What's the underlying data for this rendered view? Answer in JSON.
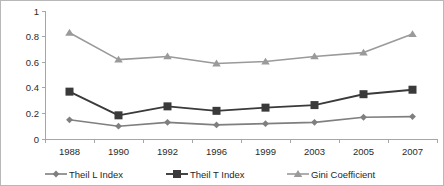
{
  "chart_data": {
    "type": "line",
    "title": "",
    "subtitle": "",
    "xlabel": "",
    "ylabel": "",
    "categories": [
      "1988",
      "1990",
      "1992",
      "1996",
      "1999",
      "2003",
      "2005",
      "2007"
    ],
    "ylim": [
      0,
      1
    ],
    "yticks": [
      "0",
      "0.2",
      "0.4",
      "0.6",
      "0.8",
      "1"
    ],
    "ytick_values": [
      0,
      0.2,
      0.4,
      0.6,
      0.8,
      1
    ],
    "grid": false,
    "legend_position": "bottom",
    "series": [
      {
        "name": "Theil L Index",
        "marker": "diamond",
        "color": "#7f7f7f",
        "values": [
          0.15,
          0.1,
          0.13,
          0.11,
          0.12,
          0.13,
          0.17,
          0.175
        ]
      },
      {
        "name": "Theil T Index",
        "marker": "square",
        "color": "#3a3a3a",
        "values": [
          0.37,
          0.185,
          0.255,
          0.22,
          0.245,
          0.265,
          0.35,
          0.385
        ]
      },
      {
        "name": "Gini Coefficient",
        "marker": "triangle",
        "color": "#9a9a9a",
        "values": [
          0.83,
          0.62,
          0.645,
          0.59,
          0.605,
          0.645,
          0.675,
          0.82
        ]
      }
    ]
  },
  "legend": {
    "items": [
      {
        "label": "Theil L Index",
        "marker": "diamond",
        "color": "#7f7f7f"
      },
      {
        "label": "Theil T Index",
        "marker": "square",
        "color": "#3a3a3a"
      },
      {
        "label": "Gini Coefficient",
        "marker": "triangle",
        "color": "#9a9a9a"
      }
    ]
  },
  "colors": {
    "border": "#b8b8b8",
    "axis": "#a6a6a6",
    "text": "#2b2b2b",
    "background": "#ffffff"
  }
}
